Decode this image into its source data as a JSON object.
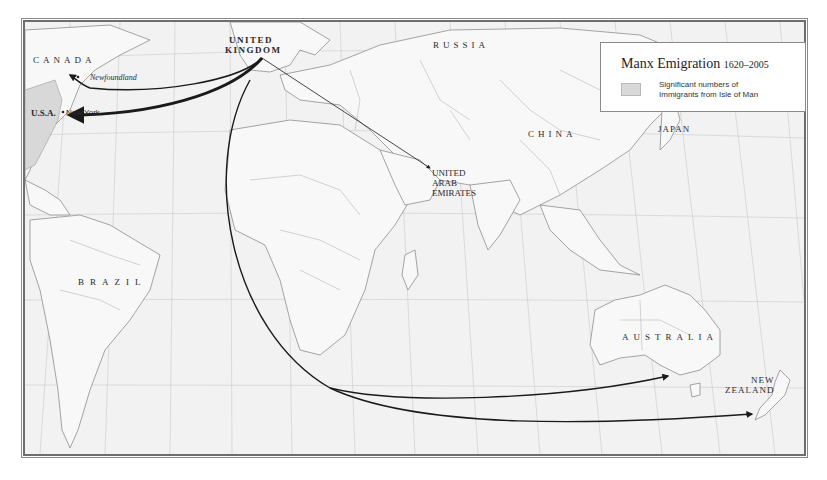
{
  "map": {
    "legend": {
      "title": "Manx Emigration",
      "years": "1620–2005",
      "swatch_label_line1": "Significant numbers of",
      "swatch_label_line2": "Immigrants from Isle of Man",
      "swatch_color": "#d8d8d8"
    },
    "labels": {
      "canada": "CANADA",
      "usa": "U.S.A.",
      "new_york": "New York",
      "newfoundland": "Newfoundland",
      "uk_line1": "UNITED",
      "uk_line2": "KINGDOM",
      "russia": "RUSSIA",
      "china": "CHINA",
      "japan": "JAPAN",
      "uae_line1": "UNITED",
      "uae_line2": "ARAB",
      "uae_line3": "EMIRATES",
      "brazil": "BRAZIL",
      "australia": "AUSTRALIA",
      "nz_line1": "NEW",
      "nz_line2": "ZEALAND"
    },
    "routes": [
      {
        "from": "United Kingdom",
        "to": "Newfoundland",
        "weight": "medium"
      },
      {
        "from": "United Kingdom",
        "to": "New York",
        "weight": "heavy"
      },
      {
        "from": "United Kingdom",
        "to": "United Arab Emirates",
        "weight": "thin"
      },
      {
        "from": "United Kingdom",
        "to": "Australia",
        "weight": "medium"
      },
      {
        "from": "United Kingdom",
        "to": "New Zealand",
        "weight": "medium"
      }
    ],
    "colors": {
      "ocean": "#f2f2f2",
      "land": "#f7f7f7",
      "borders": "#9a9a9a",
      "routes": "#1a1a1a",
      "shaded": "#d8d8d8"
    }
  }
}
